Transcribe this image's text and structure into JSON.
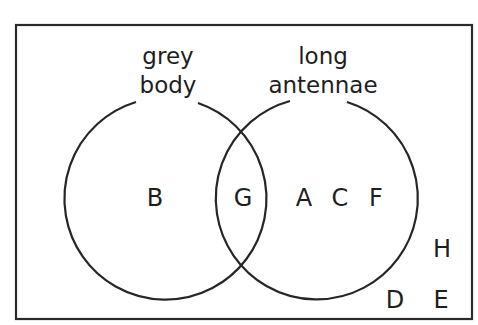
{
  "diagram": {
    "type": "venn",
    "universal_set": {
      "members_outside": [
        "H",
        "D",
        "E"
      ]
    },
    "sets": [
      {
        "name": "grey body",
        "label_lines": [
          "grey",
          "body"
        ],
        "only_members": [
          "B"
        ]
      },
      {
        "name": "long antennae",
        "label_lines": [
          "long",
          "antennae"
        ],
        "only_members": [
          "A",
          "C",
          "F"
        ]
      }
    ],
    "intersection_members": [
      "G"
    ]
  },
  "labels": {
    "left_line1": "grey",
    "left_line2": "body",
    "right_line1": "long",
    "right_line2": "antennae"
  },
  "members": {
    "B": "B",
    "G": "G",
    "A": "A",
    "C": "C",
    "F": "F",
    "H": "H",
    "D": "D",
    "E": "E"
  },
  "colors": {
    "stroke": "#262626",
    "text": "#1e1e1e",
    "background": "#ffffff"
  }
}
